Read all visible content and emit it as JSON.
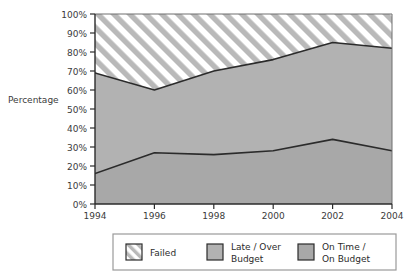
{
  "chart_data": {
    "type": "area",
    "title": "",
    "subtitle": "",
    "xlabel": "",
    "ylabel": "Percentage",
    "stacked": true,
    "grid": false,
    "legend_position": "bottom",
    "x": [
      1994,
      1996,
      1998,
      2000,
      2002,
      2004
    ],
    "categories": [
      "1994",
      "1996",
      "1998",
      "2000",
      "2002",
      "2004"
    ],
    "xlim": [
      1994,
      2004
    ],
    "ylim": [
      0,
      100
    ],
    "y_ticks": [
      0,
      10,
      20,
      30,
      40,
      50,
      60,
      70,
      80,
      90,
      100
    ],
    "y_tick_labels": [
      "0%",
      "10%",
      "20%",
      "30%",
      "40%",
      "50%",
      "60%",
      "70%",
      "80%",
      "90%",
      "100%"
    ],
    "x_ticks": [
      1994,
      1996,
      1998,
      2000,
      2002,
      2004
    ],
    "x_tick_labels": [
      "1994",
      "1996",
      "1998",
      "2000",
      "2002",
      "2004"
    ],
    "boundaries": {
      "lower_line": [
        16,
        27,
        26,
        28,
        34,
        28
      ],
      "upper_line": [
        69,
        60,
        70,
        76,
        85,
        82
      ]
    },
    "series": [
      {
        "name": "On Time / On Budget",
        "fill": "#a8a8a8",
        "pattern": "solid",
        "values": [
          16,
          27,
          26,
          28,
          34,
          28
        ]
      },
      {
        "name": "Late / Over Budget",
        "fill": "#b2b2b2",
        "pattern": "solid",
        "values": [
          53,
          33,
          44,
          48,
          51,
          54
        ]
      },
      {
        "name": "Failed",
        "fill": "#ffffff",
        "pattern": "diagonal-hatch",
        "values": [
          31,
          40,
          30,
          24,
          15,
          18
        ]
      }
    ]
  },
  "legend": {
    "items": [
      {
        "label": "Failed",
        "swatch": "diagonal-hatch"
      },
      {
        "label_line1": "Late / Over",
        "label_line2": "Budget",
        "swatch": "light-gray"
      },
      {
        "label_line1": "On Time /",
        "label_line2": "On Budget",
        "swatch": "dark-gray"
      }
    ]
  },
  "colors": {
    "on_time_fill": "#a8a8a8",
    "late_over_fill": "#b2b2b2",
    "failed_fill": "#ffffff",
    "hatch_stroke": "#b7b7b7",
    "line_stroke": "#2b2b2b",
    "axis_stroke": "#2b2b2b",
    "text": "#3b3b3b",
    "legend_border": "#9a9a9a",
    "background": "#ffffff"
  }
}
